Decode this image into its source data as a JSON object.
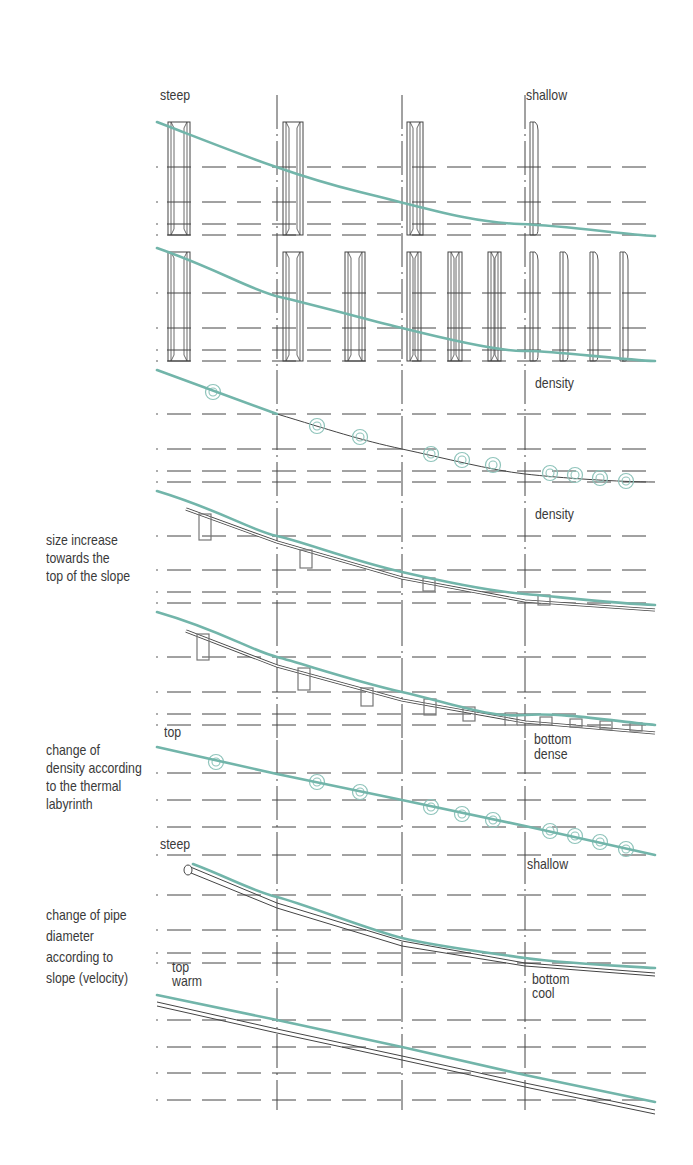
{
  "colors": {
    "teal": "#72b5aa",
    "ink": "#3a3a3a",
    "grid": "#444444",
    "circle": "#8fc4bb",
    "box": "#777777"
  },
  "grid": {
    "x_start": 157,
    "x_end": 655,
    "verticals": [
      277,
      402,
      525
    ],
    "vertical_segments": [
      [
        95,
        370
      ],
      [
        370,
        612
      ],
      [
        612,
        740
      ],
      [
        740,
        850
      ],
      [
        850,
        1110
      ]
    ]
  },
  "panels": [
    {
      "id": "pipes-steep-shallow",
      "labels": {
        "left": "steep",
        "right": "shallow"
      },
      "rows": [
        167,
        202,
        224,
        235
      ],
      "curve": "M157,122 C230,150 290,175 360,192 S470,222 520,224 S620,234 655,236",
      "elements": [
        {
          "type": "channel",
          "x": 168,
          "top": 122,
          "bottom": 235,
          "w": 22
        },
        {
          "type": "channel",
          "x": 283,
          "top": 122,
          "bottom": 235,
          "w": 20
        },
        {
          "type": "channel",
          "x": 407,
          "top": 122,
          "bottom": 235,
          "w": 16
        },
        {
          "type": "plate",
          "x": 530,
          "top": 122,
          "bottom": 235,
          "w": 8
        }
      ]
    },
    {
      "id": "pipes-repeated",
      "labels": {},
      "rows": [
        293,
        328,
        350,
        361
      ],
      "curve": "M157,248 C220,270 250,290 280,297 S370,320 402,328 S500,352 525,351 S620,360 655,361",
      "elements": [
        {
          "type": "channel",
          "x": 168,
          "top": 252,
          "bottom": 361,
          "w": 22
        },
        {
          "type": "channel",
          "x": 283,
          "top": 252,
          "bottom": 361,
          "w": 20
        },
        {
          "type": "channel",
          "x": 345,
          "top": 252,
          "bottom": 361,
          "w": 20
        },
        {
          "type": "channel",
          "x": 407,
          "top": 252,
          "bottom": 361,
          "w": 14
        },
        {
          "type": "channel",
          "x": 448,
          "top": 252,
          "bottom": 361,
          "w": 14
        },
        {
          "type": "channel",
          "x": 488,
          "top": 252,
          "bottom": 361,
          "w": 13
        },
        {
          "type": "plate",
          "x": 530,
          "top": 252,
          "bottom": 361,
          "w": 8
        },
        {
          "type": "plate",
          "x": 560,
          "top": 252,
          "bottom": 361,
          "w": 8
        },
        {
          "type": "plate",
          "x": 590,
          "top": 252,
          "bottom": 361,
          "w": 8
        },
        {
          "type": "plate",
          "x": 620,
          "top": 252,
          "bottom": 361,
          "w": 8
        }
      ]
    },
    {
      "id": "density-circles",
      "labels": {
        "right": "density"
      },
      "rows": [
        414,
        449,
        471,
        482
      ],
      "curve_teal": "M157,370 L277,414",
      "curve_black": "M277,414 C330,430 360,440 402,449 S490,470 525,474 S620,482 655,482",
      "circles": [
        [
          213,
          392
        ],
        [
          317,
          426
        ],
        [
          360,
          437
        ],
        [
          431,
          454
        ],
        [
          462,
          460
        ],
        [
          493,
          465
        ],
        [
          550,
          473
        ],
        [
          575,
          475
        ],
        [
          600,
          478
        ],
        [
          626,
          481
        ]
      ]
    },
    {
      "id": "size-increase",
      "labels": {
        "right": "density",
        "side": "size increase\ntowards the\ntop of the slope"
      },
      "rows": [
        536,
        570,
        592,
        603
      ],
      "curve_teal": "M157,491 C220,510 250,530 277,536 S350,560 402,572 S500,592 525,594 S620,604 655,605",
      "pipe": "M186,509 L277,542 L402,578 L525,601 L655,610",
      "boxes": [
        [
          199,
          514,
          12,
          26
        ],
        [
          300,
          550,
          12,
          18
        ],
        [
          423,
          578,
          12,
          13
        ],
        [
          538,
          595,
          12,
          10
        ]
      ]
    },
    {
      "id": "size-increase-repeated",
      "labels": {
        "bottom_left": "top",
        "bottom_right": "bottom\ndense"
      },
      "rows": [
        657,
        692,
        714,
        725
      ],
      "curve_teal": "M157,612 C220,630 250,650 277,657 S350,680 402,692 S490,718 525,715 S620,722 655,725",
      "pipe": "M186,631 L277,666 L402,700 L525,722 L655,733",
      "boxes": [
        [
          197,
          634,
          12,
          26
        ],
        [
          298,
          668,
          12,
          22
        ],
        [
          361,
          688,
          12,
          18
        ],
        [
          424,
          699,
          12,
          16
        ],
        [
          463,
          707,
          12,
          14
        ],
        [
          505,
          713,
          12,
          12
        ],
        [
          540,
          717,
          12,
          8
        ],
        [
          570,
          719,
          12,
          8
        ],
        [
          600,
          721,
          12,
          8
        ],
        [
          630,
          723,
          12,
          8
        ]
      ]
    },
    {
      "id": "thermal-labyrinth",
      "labels": {
        "side": "change of\ndensity according\nto the thermal\nlabyrinth",
        "bottom_right": "shallow"
      },
      "rows": [
        773,
        800,
        827
      ],
      "curve_teal": "M157,747 L277,774 L402,800 L525,826 L655,855",
      "circles": [
        [
          216,
          762
        ],
        [
          317,
          782
        ],
        [
          360,
          792
        ],
        [
          431,
          807
        ],
        [
          462,
          814
        ],
        [
          493,
          820
        ],
        [
          550,
          831
        ],
        [
          575,
          836
        ],
        [
          600,
          842
        ],
        [
          626,
          849
        ]
      ]
    },
    {
      "id": "pipe-diameter",
      "labels": {
        "top_left": "steep",
        "side": "change of pipe\ndiameter\naccording to\nslope (velocity)",
        "bottom_left": "top\nwarm",
        "bottom_right": "bottom\ncool"
      },
      "rows": [
        855,
        895,
        930,
        953,
        963
      ],
      "curve_teal": "M193,864 C230,878 250,890 277,897 S370,930 402,938 S490,953 525,958 S620,966 655,968",
      "pipe_outer": "M188,866 L277,903 L402,941 L525,963 L655,973",
      "pipe_inner": "M191,873 L277,908 L402,946 L525,966 L655,976",
      "pipe_start": [
        188,
        870
      ]
    },
    {
      "id": "gradient-warm-cool",
      "labels": {},
      "rows": [
        1020,
        1047,
        1073,
        1100
      ],
      "curve_teal": "M157,995 L277,1020 L402,1047 L525,1075 L655,1102",
      "pipe_outer": "M157,1002 L277,1029 L402,1056 L525,1083 L655,1110",
      "pipe_inner": "M157,1006 L277,1033 L402,1060 L525,1087 L655,1114"
    }
  ],
  "text": {
    "steep": "steep",
    "shallow": "shallow",
    "density_1": "density",
    "density_2": "density",
    "size_increase": "size increase\ntowards the\ntop of the slope",
    "top_1": "top",
    "bottom_dense": "bottom\ndense",
    "change_density": "change of\ndensity according\nto the thermal\nlabyrinth",
    "steep_2": "steep",
    "shallow_2": "shallow",
    "change_pipe": "change of pipe\ndiameter\naccording to\nslope (velocity)",
    "top_warm": "top\nwarm",
    "bottom_cool": "bottom\ncool"
  }
}
